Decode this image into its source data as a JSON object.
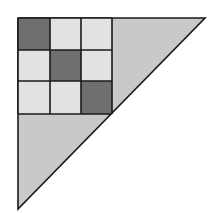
{
  "figure": {
    "colors": {
      "background": "#ffffff",
      "triangle_fill": "#c9c9c9",
      "light_cell": "#e2e2e2",
      "dark_cell": "#6f6f6f",
      "stroke": "#1a1a1a"
    },
    "triangle": {
      "points": [
        [
          18,
          18
        ],
        [
          205,
          18
        ],
        [
          18,
          209
        ]
      ]
    },
    "grid": {
      "x_lines": [
        18,
        50,
        81,
        112
      ],
      "y_lines": [
        18,
        50,
        81,
        114
      ],
      "cells": [
        [
          "dark",
          "light",
          "light"
        ],
        [
          "light",
          "dark",
          "light"
        ],
        [
          "light",
          "light",
          "dark"
        ]
      ]
    }
  }
}
